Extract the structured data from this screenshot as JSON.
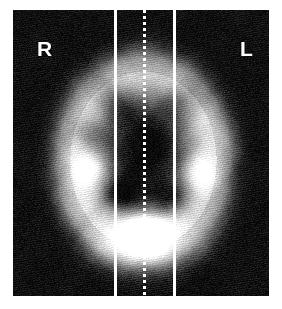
{
  "viewer": {
    "modality_label": "axial-brain-perfusion-slice",
    "background_color": "#000000",
    "page_color": "#ffffff",
    "overlay_color": "#ffffff"
  },
  "labels": {
    "right": "R",
    "left": "L"
  },
  "overlay": {
    "line_left_x": 114,
    "line_right_x": 173,
    "midline_x": 143,
    "midline_style": "dotted"
  },
  "chart_data": {
    "type": "heatmap",
    "title": "",
    "xlabel": "",
    "ylabel": "",
    "colormap": "grayscale",
    "value_range": [
      0,
      255
    ],
    "grid": false,
    "legend": "none",
    "annotations": [
      {
        "text": "R",
        "x": 37,
        "y": 38
      },
      {
        "text": "L",
        "x": 240,
        "y": 38
      }
    ],
    "regions": [
      {
        "name": "background",
        "cx": 30,
        "cy": 30,
        "rx": 30,
        "ry": 30,
        "intensity": 14
      },
      {
        "name": "cortical-rim",
        "cx": 143,
        "cy": 160,
        "rx": 86,
        "ry": 104,
        "intensity": 205
      },
      {
        "name": "central-ventricles",
        "cx": 143,
        "cy": 150,
        "rx": 42,
        "ry": 62,
        "intensity": 60
      },
      {
        "name": "frontal-dark-left",
        "cx": 112,
        "cy": 100,
        "rx": 24,
        "ry": 22,
        "intensity": 48
      },
      {
        "name": "frontal-dark-right",
        "cx": 178,
        "cy": 100,
        "rx": 26,
        "ry": 22,
        "intensity": 50
      },
      {
        "name": "basal-ganglia-right",
        "cx": 92,
        "cy": 168,
        "rx": 22,
        "ry": 20,
        "intensity": 235
      },
      {
        "name": "basal-ganglia-left",
        "cx": 196,
        "cy": 172,
        "rx": 20,
        "ry": 20,
        "intensity": 205
      },
      {
        "name": "thalamus-dark-left",
        "cx": 120,
        "cy": 196,
        "rx": 20,
        "ry": 16,
        "intensity": 52
      },
      {
        "name": "thalamus-dark-right",
        "cx": 172,
        "cy": 198,
        "rx": 22,
        "ry": 18,
        "intensity": 48
      },
      {
        "name": "posterior-hotspot",
        "cx": 146,
        "cy": 232,
        "rx": 26,
        "ry": 22,
        "intensity": 255
      },
      {
        "name": "temporal-dark-right",
        "cx": 86,
        "cy": 132,
        "rx": 16,
        "ry": 16,
        "intensity": 78
      },
      {
        "name": "occipital-rim",
        "cx": 143,
        "cy": 248,
        "rx": 58,
        "ry": 22,
        "intensity": 180
      }
    ]
  }
}
